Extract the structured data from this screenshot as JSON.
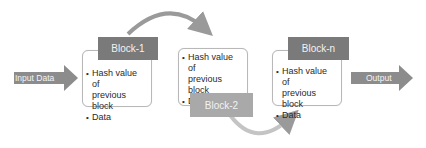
{
  "diagram": {
    "input_arrow": {
      "label": "Input Data"
    },
    "output_arrow": {
      "label": "Output"
    },
    "blocks": [
      {
        "title": "Block-1",
        "items": [
          "Hash value of",
          "previous block",
          "Data"
        ]
      },
      {
        "title": "Block-2",
        "items": [
          "Hash value of",
          "previous block",
          "Data"
        ]
      },
      {
        "title": "Block-n",
        "items": [
          "Hash value of",
          "previous block",
          "Data"
        ]
      }
    ],
    "colors": {
      "header_dark": "#7a7a7a",
      "header_light": "#a9a9a9",
      "arrow": "#8c8c8c",
      "curve": "#9a9a9a",
      "border": "#b8b8b8"
    }
  }
}
